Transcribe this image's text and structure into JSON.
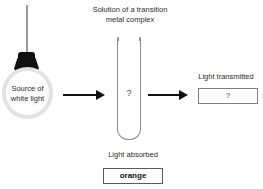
{
  "diagram": {
    "title": "Solution of a transition\nmetal complex",
    "clipped_top_text": "",
    "colors": {
      "ink": "#1a1a1a",
      "arrow": "#111111",
      "tube_outline": "#8d8d8d",
      "bulb_glass": "#e2e2e4",
      "bulb_base": "#111111",
      "box_border": "#5a5a5a"
    }
  },
  "source": {
    "label": "Source of\nwhite light",
    "icon": "light-bulb-icon"
  },
  "solution": {
    "caption": "Solution of a transition\nmetal complex",
    "contents_value": "?",
    "icon": "test-tube-icon"
  },
  "transmitted": {
    "label": "Light transmitted",
    "value": "?"
  },
  "absorbed": {
    "label": "Light absorbed",
    "value": "orange"
  },
  "arrows": [
    {
      "name": "arrow-source-to-solution",
      "direction": "right"
    },
    {
      "name": "arrow-solution-to-transmitted",
      "direction": "right"
    }
  ]
}
